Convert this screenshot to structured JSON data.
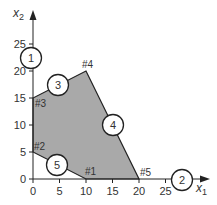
{
  "diagram": {
    "type": "linear-programming-feasible-region",
    "x_axis": {
      "label": "x",
      "subscript": "1",
      "ticks": [
        "0",
        "5",
        "10",
        "15",
        "20",
        "25"
      ],
      "tick_values": [
        0,
        5,
        10,
        15,
        20,
        25
      ]
    },
    "y_axis": {
      "label": "x",
      "subscript": "2",
      "ticks": [
        "0",
        "5",
        "10",
        "15",
        "20",
        "25"
      ],
      "tick_values": [
        0,
        5,
        10,
        15,
        20,
        25
      ]
    },
    "region_fill": "#a9a9a9",
    "vertices": [
      {
        "label": "#1",
        "x": 10,
        "y": 0
      },
      {
        "label": "#2",
        "x": 0,
        "y": 5
      },
      {
        "label": "#3",
        "x": 0,
        "y": 15
      },
      {
        "label": "#4",
        "x": 10,
        "y": 20
      },
      {
        "label": "#5",
        "x": 20,
        "y": 0
      }
    ],
    "constraint_labels": [
      {
        "label": "1",
        "near": "x2 axis at 23"
      },
      {
        "label": "2",
        "near": "x1 axis at 28"
      },
      {
        "label": "3",
        "near": "edge #3-#4"
      },
      {
        "label": "4",
        "near": "edge #4-#5"
      },
      {
        "label": "5",
        "near": "edge #2-#1"
      }
    ]
  }
}
